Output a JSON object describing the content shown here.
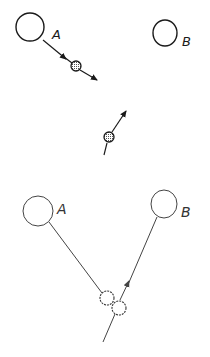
{
  "diagram": {
    "panels": [
      {
        "name": "top",
        "bodies": [
          {
            "label": "A",
            "cx": 30,
            "cy": 27,
            "r": 14
          },
          {
            "label": "B",
            "cx": 165,
            "cy": 33,
            "r": 12
          }
        ],
        "particles": [
          {
            "cx": 76,
            "cy": 66,
            "r": 5,
            "direction": "away-from-A"
          },
          {
            "cx": 109,
            "cy": 137,
            "r": 5,
            "direction": "up-right"
          }
        ]
      },
      {
        "name": "bottom",
        "bodies": [
          {
            "label": "A",
            "cx": 38,
            "cy": 210,
            "r": 15
          },
          {
            "label": "B",
            "cx": 165,
            "cy": 204,
            "r": 14
          }
        ],
        "particles": [
          {
            "cx": 107,
            "cy": 298,
            "r": 7
          },
          {
            "cx": 119,
            "cy": 308,
            "r": 7
          }
        ]
      }
    ],
    "labels": {
      "top_a": "A",
      "top_b": "B",
      "bottom_a": "A",
      "bottom_b": "B"
    },
    "colors": {
      "ink": "#1a1a1a",
      "ink_light": "#444444",
      "background": "#ffffff"
    }
  }
}
